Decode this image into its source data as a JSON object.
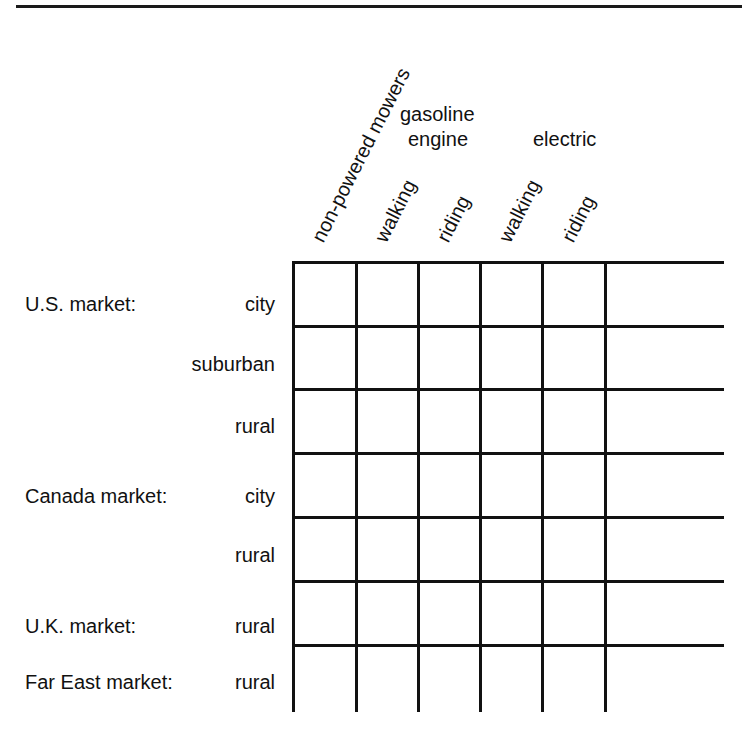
{
  "diagram": {
    "column_groups": [
      {
        "label": "gasoline",
        "label_line2": "engine"
      },
      {
        "label": "electric"
      }
    ],
    "columns": [
      {
        "label": "non-powered mowers"
      },
      {
        "label": "walking",
        "group": "gasoline engine"
      },
      {
        "label": "riding",
        "group": "gasoline engine"
      },
      {
        "label": "walking",
        "group": "electric"
      },
      {
        "label": "riding",
        "group": "electric"
      }
    ],
    "rows": [
      {
        "market": "U.S. market:",
        "segment": "city"
      },
      {
        "market": "",
        "segment": "suburban"
      },
      {
        "market": "",
        "segment": "rural"
      },
      {
        "market": "Canada market:",
        "segment": "city"
      },
      {
        "market": "",
        "segment": "rural"
      },
      {
        "market": "U.K. market:",
        "segment": "rural"
      },
      {
        "market": "Far East market:",
        "segment": "rural"
      }
    ],
    "line_color": "#111111",
    "background_color": "#ffffff"
  }
}
